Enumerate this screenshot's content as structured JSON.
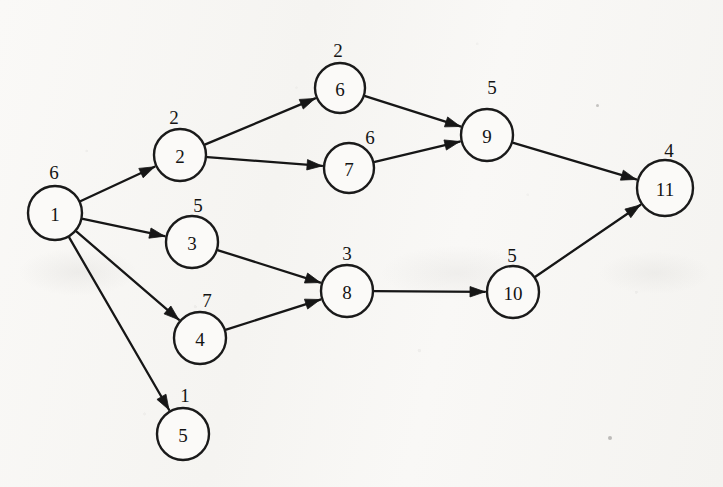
{
  "figure": {
    "background_color": "#f7f6f3",
    "ink_color": "#161616",
    "node_fill_color": "#fbfaf8"
  },
  "graph": {
    "node_radius": 26,
    "nodes": [
      {
        "id": "n1",
        "label": "1",
        "weight": "6",
        "cx": 55,
        "cy": 213,
        "r": 27,
        "wx": 54,
        "wy": 172
      },
      {
        "id": "n2",
        "label": "2",
        "weight": "2",
        "cx": 180,
        "cy": 155,
        "r": 26,
        "wx": 174,
        "wy": 117
      },
      {
        "id": "n3",
        "label": "3",
        "weight": "5",
        "cx": 192,
        "cy": 242,
        "r": 26,
        "wx": 198,
        "wy": 205
      },
      {
        "id": "n4",
        "label": "4",
        "weight": "7",
        "cx": 200,
        "cy": 338,
        "r": 26,
        "wx": 207,
        "wy": 300
      },
      {
        "id": "n5",
        "label": "5",
        "weight": "1",
        "cx": 183,
        "cy": 434,
        "r": 26,
        "wx": 185,
        "wy": 395
      },
      {
        "id": "n6",
        "label": "6",
        "weight": "2",
        "cx": 340,
        "cy": 88,
        "r": 25,
        "wx": 338,
        "wy": 50
      },
      {
        "id": "n7",
        "label": "7",
        "weight": "6",
        "cx": 349,
        "cy": 168,
        "r": 25,
        "wx": 370,
        "wy": 137
      },
      {
        "id": "n8",
        "label": "8",
        "weight": "3",
        "cx": 347,
        "cy": 291,
        "r": 26,
        "wx": 347,
        "wy": 253
      },
      {
        "id": "n9",
        "label": "9",
        "weight": "5",
        "cx": 487,
        "cy": 135,
        "r": 26,
        "wx": 492,
        "wy": 87
      },
      {
        "id": "n10",
        "label": "10",
        "weight": "5",
        "cx": 513,
        "cy": 292,
        "r": 26,
        "wx": 512,
        "wy": 255
      },
      {
        "id": "n11",
        "label": "11",
        "weight": "4",
        "cx": 665,
        "cy": 188,
        "r": 28,
        "wx": 669,
        "wy": 150
      }
    ],
    "edges": [
      {
        "id": "e1-2",
        "from": "n1",
        "to": "n2",
        "arrow": true
      },
      {
        "id": "e1-3",
        "from": "n1",
        "to": "n3",
        "arrow": true
      },
      {
        "id": "e1-4",
        "from": "n1",
        "to": "n4",
        "arrow": true
      },
      {
        "id": "e1-5",
        "from": "n1",
        "to": "n5",
        "arrow": true
      },
      {
        "id": "e2-6",
        "from": "n2",
        "to": "n6",
        "arrow": true
      },
      {
        "id": "e2-7",
        "from": "n2",
        "to": "n7",
        "arrow": true
      },
      {
        "id": "e3-8",
        "from": "n3",
        "to": "n8",
        "arrow": true
      },
      {
        "id": "e4-8",
        "from": "n4",
        "to": "n8",
        "arrow": true
      },
      {
        "id": "e6-9",
        "from": "n6",
        "to": "n9",
        "arrow": true
      },
      {
        "id": "e7-9",
        "from": "n7",
        "to": "n9",
        "arrow": true
      },
      {
        "id": "e8-10",
        "from": "n8",
        "to": "n10",
        "arrow": true
      },
      {
        "id": "e9-11",
        "from": "n9",
        "to": "n11",
        "arrow": true
      },
      {
        "id": "e10-11",
        "from": "n10",
        "to": "n11",
        "arrow": true
      }
    ]
  }
}
